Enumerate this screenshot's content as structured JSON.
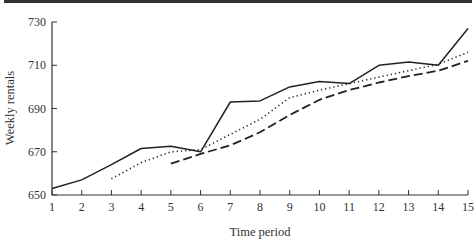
{
  "chart_data": {
    "type": "line",
    "title": "",
    "xlabel": "Time period",
    "ylabel": "Weekly rentals",
    "xlim": [
      1,
      15
    ],
    "ylim": [
      650,
      730
    ],
    "x_ticks": [
      "1",
      "2",
      "3",
      "4",
      "5",
      "6",
      "7",
      "8",
      "9",
      "10",
      "11",
      "12",
      "13",
      "14",
      "15"
    ],
    "y_ticks": [
      "650",
      "670",
      "690",
      "710",
      "730"
    ],
    "grid": false,
    "legend": null,
    "series": [
      {
        "name": "Actual weekly rentals",
        "style": "solid",
        "x": [
          1,
          2,
          3,
          4,
          5,
          6,
          7,
          8,
          9,
          10,
          11,
          12,
          13,
          14,
          15
        ],
        "values": [
          653,
          657,
          664,
          671.5,
          672.5,
          670,
          693,
          693.5,
          700,
          702.5,
          701.5,
          710,
          711.5,
          710,
          727
        ]
      },
      {
        "name": "3-period moving average",
        "style": "dotted",
        "x": [
          3,
          4,
          5,
          6,
          7,
          8,
          9,
          10,
          11,
          12,
          13,
          14,
          15
        ],
        "values": [
          657.5,
          665,
          670,
          671,
          678,
          685,
          695,
          698.5,
          701.5,
          704.5,
          707.5,
          710.5,
          716
        ]
      },
      {
        "name": "5-period moving average",
        "style": "dashed",
        "x": [
          5,
          6,
          7,
          8,
          9,
          10,
          11,
          12,
          13,
          14,
          15
        ],
        "values": [
          664.5,
          669,
          673,
          679,
          687,
          694,
          698.5,
          702,
          705,
          707.5,
          712
        ]
      }
    ]
  }
}
